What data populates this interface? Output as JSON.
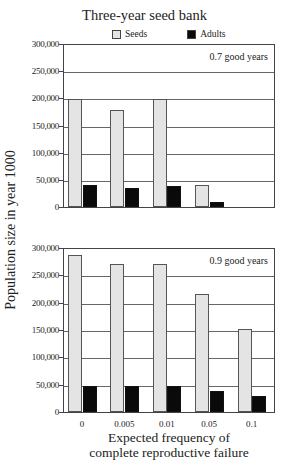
{
  "chart_data": [
    {
      "type": "bar",
      "title": "Three-year seed bank",
      "panel_label": "0.7 good years",
      "categories": [
        "0",
        "0.005",
        "0.01",
        "0.05",
        "0.1"
      ],
      "series": [
        {
          "name": "Seeds",
          "color": "#e4e4e4",
          "values": [
            198000,
            178000,
            198000,
            40000,
            0
          ]
        },
        {
          "name": "Adults",
          "color": "#0a0a0a",
          "values": [
            40000,
            35000,
            38000,
            9000,
            0
          ]
        }
      ],
      "xlabel": "Expected frequency of complete reproductive failure",
      "ylabel": "Population size in year 1000",
      "ylim": [
        0,
        300000
      ],
      "yticks": [
        "0",
        "50,000",
        "100,000",
        "150,000",
        "200,000",
        "250,000",
        "300,000"
      ],
      "grid": true,
      "legend_position": "top"
    },
    {
      "type": "bar",
      "title": "Three-year seed bank",
      "panel_label": "0.9 good years",
      "categories": [
        "0",
        "0.005",
        "0.01",
        "0.05",
        "0.1"
      ],
      "series": [
        {
          "name": "Seeds",
          "color": "#e4e4e4",
          "values": [
            287000,
            271000,
            271000,
            215000,
            152000
          ]
        },
        {
          "name": "Adults",
          "color": "#0a0a0a",
          "values": [
            48000,
            47000,
            48000,
            39000,
            30000
          ]
        }
      ],
      "xlabel": "Expected frequency of complete reproductive failure",
      "ylabel": "Population size in year 1000",
      "ylim": [
        0,
        300000
      ],
      "yticks": [
        "0",
        "50,000",
        "100,000",
        "150,000",
        "200,000",
        "250,000",
        "300,000"
      ],
      "grid": true,
      "legend_position": "top"
    }
  ],
  "title": "Three-year seed bank",
  "legend": {
    "seeds": "Seeds",
    "adults": "Adults"
  },
  "ylabel": "Population size in year 1000",
  "xlabel_line1": "Expected frequency of",
  "xlabel_line2": "complete reproductive failure",
  "panels": [
    {
      "label": "0.7 good years",
      "top": 44,
      "bottom": 207
    },
    {
      "label": "0.9 good years",
      "top": 248,
      "bottom": 412
    }
  ],
  "yticks": [
    "0",
    "50,000",
    "100,000",
    "150,000",
    "200,000",
    "250,000",
    "300,000"
  ],
  "xticks": [
    "0",
    "0.005",
    "0.01",
    "0.05",
    "0.1"
  ]
}
